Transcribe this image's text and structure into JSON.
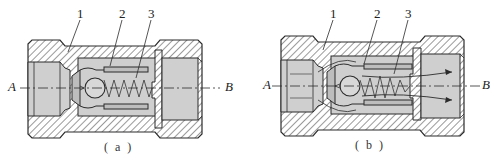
{
  "figure": {
    "panels": [
      {
        "id": "a",
        "caption": "( a )",
        "part_labels": [
          "1",
          "2",
          "3"
        ],
        "port_in": "A",
        "port_out": "B",
        "state": "closed"
      },
      {
        "id": "b",
        "caption": "( b )",
        "part_labels": [
          "1",
          "2",
          "3"
        ],
        "port_in": "A",
        "port_out": "B",
        "state": "open-flow"
      }
    ],
    "figure_caption_faint": "",
    "colors": {
      "outline": "#2b2b2b",
      "hatch": "#555555",
      "fill_gray": "#cfcfcf",
      "background": "#ffffff"
    }
  }
}
